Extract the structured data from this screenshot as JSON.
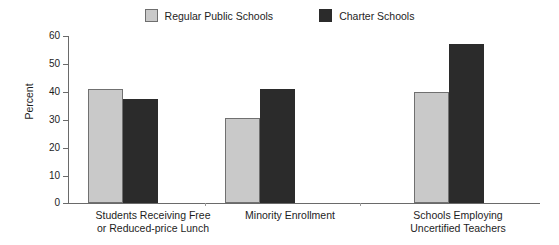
{
  "chart_data": {
    "type": "bar",
    "title": "",
    "subtitle": "",
    "xlabel": "",
    "ylabel": "Percent",
    "ylim": [
      0,
      60
    ],
    "yticks": [
      0,
      10,
      20,
      30,
      40,
      50,
      60
    ],
    "ytick_labels": [
      "0",
      "10",
      "20",
      "30",
      "40",
      "50",
      "60"
    ],
    "grid": false,
    "legend_position": "top-center",
    "categories": [
      "Students Receiving Free or Reduced-price Lunch",
      "Minority Enrollment",
      "Schools Employing Uncertified Teachers"
    ],
    "category_lines": [
      [
        "Students Receiving Free",
        "or Reduced-price Lunch"
      ],
      [
        "Minority Enrollment",
        ""
      ],
      [
        "Schools Employing",
        "Uncertified Teachers"
      ]
    ],
    "series": [
      {
        "name": "Regular Public Schools",
        "color": "#c9c9c9",
        "edge_color": "#707070",
        "values": [
          41,
          30.5,
          40
        ]
      },
      {
        "name": "Charter Schools",
        "color": "#2b2b2b",
        "edge_color": "#2b2b2b",
        "values": [
          37.5,
          41,
          57
        ]
      }
    ]
  },
  "legend": {
    "entries": [
      {
        "label": "Regular Public Schools",
        "swatch": "light-gray-square-icon"
      },
      {
        "label": "Charter Schools",
        "swatch": "dark-square-icon"
      }
    ]
  },
  "axis": {
    "y_title": "Percent",
    "y_tick_labels": [
      "60",
      "50",
      "40",
      "30",
      "20",
      "10",
      "0"
    ]
  },
  "colors": {
    "series_light": "#c9c9c9",
    "series_dark": "#2b2b2b",
    "axis": "#6a6a6a",
    "text": "#1d1d1d",
    "background": "#ffffff"
  }
}
